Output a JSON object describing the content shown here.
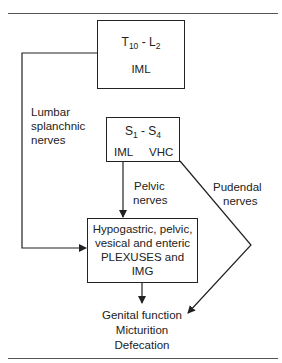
{
  "diagram": {
    "nodes": {
      "thoracolumbar": {
        "segment_start": "T",
        "segment_start_sub": "10",
        "separator": " - ",
        "segment_end": "L",
        "segment_end_sub": "2",
        "nucleus": "IML"
      },
      "sacral": {
        "segment_start": "S",
        "segment_start_sub": "1",
        "separator": " - ",
        "segment_end": "S",
        "segment_end_sub": "4",
        "nucleus_left": "IML",
        "nucleus_right": "VHC"
      },
      "plexuses": {
        "lines": [
          "Hypogastric, pelvic,",
          "vesical and enteric",
          "PLEXUSES and",
          "IMG"
        ]
      },
      "outcomes": {
        "lines": [
          "Genital function",
          "Micturition",
          "Defecation"
        ]
      }
    },
    "edges": {
      "lumbar_splanchnic": {
        "lines": [
          "Lumbar",
          "splanchnic",
          "nerves"
        ]
      },
      "pelvic": {
        "lines": [
          "Pelvic",
          "nerves"
        ]
      },
      "pudendal": {
        "lines": [
          "Pudendal",
          "nerves"
        ]
      }
    }
  }
}
